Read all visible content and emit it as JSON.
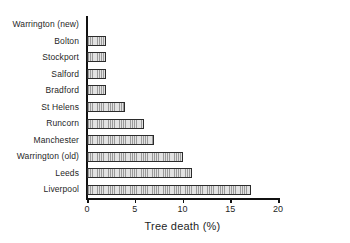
{
  "chart_data": {
    "type": "bar",
    "orientation": "horizontal",
    "title": "",
    "xlabel": "Tree death (%)",
    "ylabel": "",
    "xlim": [
      0,
      20
    ],
    "xticks": [
      0,
      5,
      10,
      15,
      20
    ],
    "xtick_labels": [
      "0",
      "5",
      "10",
      "15",
      "20"
    ],
    "grid": false,
    "legend": null,
    "categories": [
      "Warrington (new)",
      "Bolton",
      "Stockport",
      "Salford",
      "Bradford",
      "St Helens",
      "Runcorn",
      "Manchester",
      "Warrington (old)",
      "Leeds",
      "Liverpool"
    ],
    "values": [
      0.2,
      2.0,
      2.0,
      2.0,
      2.0,
      4.0,
      6.0,
      7.0,
      10.0,
      11.0,
      17.2
    ],
    "bar_fill": "#d6d6d6",
    "bar_hatch": "vertical-lines",
    "bar_edge_color": "#2b2b2b",
    "axis_color": "#111111",
    "text_color": "#1f1f1f"
  }
}
